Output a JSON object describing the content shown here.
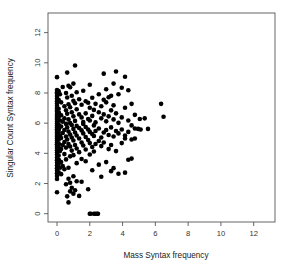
{
  "chart_data": {
    "type": "scatter",
    "title": "",
    "xlabel": "Mass Syntax frequency",
    "ylabel": "Singular Count Syntax frequency",
    "xlim": [
      -0.55,
      13.3
    ],
    "ylim": [
      -0.55,
      13.3
    ],
    "xticks": [
      0,
      2,
      4,
      6,
      8,
      10,
      12
    ],
    "yticks": [
      0,
      2,
      4,
      6,
      8,
      10,
      12
    ],
    "xticklabels": [
      "0",
      "2",
      "4",
      "6",
      "8",
      "10",
      "12"
    ],
    "yticklabels": [
      "0",
      "2",
      "4",
      "6",
      "8",
      "10",
      "12"
    ],
    "grid": false,
    "legend": null,
    "marker": "filled-circle",
    "marker_color": "#000000",
    "marker_size": 2.3,
    "background": "#ffffff",
    "frame": true,
    "n_points": 214,
    "points": [
      [
        0.0,
        9.05
      ],
      [
        0.0,
        8.2
      ],
      [
        0.0,
        8.05
      ],
      [
        0.0,
        7.95
      ],
      [
        0.0,
        7.8
      ],
      [
        0.0,
        7.62
      ],
      [
        0.0,
        7.45
      ],
      [
        0.0,
        7.3
      ],
      [
        0.0,
        7.15
      ],
      [
        0.0,
        7.0
      ],
      [
        0.0,
        6.88
      ],
      [
        0.0,
        6.75
      ],
      [
        0.0,
        6.6
      ],
      [
        0.0,
        6.48
      ],
      [
        0.0,
        6.35
      ],
      [
        0.0,
        6.22
      ],
      [
        0.0,
        6.1
      ],
      [
        0.0,
        5.98
      ],
      [
        0.0,
        5.85
      ],
      [
        0.0,
        5.72
      ],
      [
        0.0,
        5.6
      ],
      [
        0.0,
        5.48
      ],
      [
        0.0,
        5.35
      ],
      [
        0.0,
        5.22
      ],
      [
        0.0,
        5.1
      ],
      [
        0.0,
        4.98
      ],
      [
        0.0,
        4.85
      ],
      [
        0.0,
        4.72
      ],
      [
        0.0,
        4.6
      ],
      [
        0.0,
        4.48
      ],
      [
        0.0,
        4.35
      ],
      [
        0.0,
        4.2
      ],
      [
        0.0,
        4.05
      ],
      [
        0.0,
        3.9
      ],
      [
        0.0,
        3.72
      ],
      [
        0.0,
        3.55
      ],
      [
        0.0,
        3.38
      ],
      [
        0.0,
        3.2
      ],
      [
        0.0,
        3.02
      ],
      [
        0.0,
        2.85
      ],
      [
        0.0,
        2.68
      ],
      [
        0.0,
        2.5
      ],
      [
        0.0,
        2.3
      ],
      [
        0.0,
        1.42
      ],
      [
        0.1,
        8.12
      ],
      [
        0.1,
        7.55
      ],
      [
        0.1,
        6.95
      ],
      [
        0.1,
        6.4
      ],
      [
        0.1,
        5.9
      ],
      [
        0.1,
        5.42
      ],
      [
        0.1,
        4.9
      ],
      [
        0.1,
        4.4
      ],
      [
        0.1,
        3.85
      ],
      [
        0.1,
        3.3
      ],
      [
        0.1,
        2.75
      ],
      [
        0.12,
        6.68
      ],
      [
        0.12,
        5.62
      ],
      [
        0.12,
        4.62
      ],
      [
        0.12,
        3.55
      ],
      [
        0.18,
        7.92
      ],
      [
        0.18,
        6.18
      ],
      [
        0.18,
        5.18
      ],
      [
        0.18,
        4.15
      ],
      [
        0.18,
        3.05
      ],
      [
        0.25,
        7.38
      ],
      [
        0.25,
        6.52
      ],
      [
        0.25,
        5.78
      ],
      [
        0.25,
        5.02
      ],
      [
        0.25,
        4.28
      ],
      [
        0.25,
        3.42
      ],
      [
        0.25,
        2.62
      ],
      [
        0.35,
        8.4
      ],
      [
        0.35,
        6.1
      ],
      [
        0.35,
        5.35
      ],
      [
        0.35,
        4.55
      ],
      [
        0.35,
        3.15
      ],
      [
        0.45,
        7.12
      ],
      [
        0.45,
        6.32
      ],
      [
        0.45,
        5.55
      ],
      [
        0.45,
        4.75
      ],
      [
        0.45,
        3.95
      ],
      [
        0.45,
        2.95
      ],
      [
        0.55,
        8.0
      ],
      [
        0.55,
        6.85
      ],
      [
        0.55,
        5.95
      ],
      [
        0.55,
        5.12
      ],
      [
        0.55,
        4.38
      ],
      [
        0.55,
        3.6
      ],
      [
        0.55,
        1.95
      ],
      [
        0.62,
        9.35
      ],
      [
        0.62,
        7.7
      ],
      [
        0.62,
        6.62
      ],
      [
        0.62,
        5.72
      ],
      [
        0.62,
        4.92
      ],
      [
        0.62,
        1.15
      ],
      [
        0.7,
        8.48
      ],
      [
        0.7,
        7.25
      ],
      [
        0.7,
        6.25
      ],
      [
        0.7,
        5.45
      ],
      [
        0.7,
        4.62
      ],
      [
        0.7,
        3.05
      ],
      [
        0.7,
        2.32
      ],
      [
        0.7,
        0.75
      ],
      [
        0.8,
        8.38
      ],
      [
        0.8,
        7.05
      ],
      [
        0.8,
        6.0
      ],
      [
        0.8,
        5.25
      ],
      [
        0.8,
        4.45
      ],
      [
        0.8,
        3.8
      ],
      [
        0.8,
        2.05
      ],
      [
        0.8,
        1.48
      ],
      [
        0.9,
        7.82
      ],
      [
        0.9,
        6.72
      ],
      [
        0.9,
        5.88
      ],
      [
        0.9,
        5.05
      ],
      [
        0.9,
        4.18
      ],
      [
        0.9,
        1.72
      ],
      [
        1.0,
        8.62
      ],
      [
        1.0,
        7.48
      ],
      [
        1.0,
        6.45
      ],
      [
        1.0,
        5.62
      ],
      [
        1.0,
        4.85
      ],
      [
        1.0,
        3.88
      ],
      [
        1.0,
        2.48
      ],
      [
        1.0,
        1.32
      ],
      [
        1.1,
        9.82
      ],
      [
        1.1,
        7.32
      ],
      [
        1.1,
        6.15
      ],
      [
        1.1,
        5.38
      ],
      [
        1.1,
        4.55
      ],
      [
        1.1,
        1.55
      ],
      [
        1.2,
        8.05
      ],
      [
        1.2,
        6.92
      ],
      [
        1.2,
        5.82
      ],
      [
        1.2,
        5.18
      ],
      [
        1.2,
        4.32
      ],
      [
        1.2,
        3.35
      ],
      [
        1.2,
        2.15
      ],
      [
        1.35,
        7.58
      ],
      [
        1.35,
        6.58
      ],
      [
        1.35,
        5.68
      ],
      [
        1.35,
        4.98
      ],
      [
        1.35,
        4.08
      ],
      [
        1.35,
        1.18
      ],
      [
        1.5,
        7.22
      ],
      [
        1.5,
        6.38
      ],
      [
        1.5,
        5.52
      ],
      [
        1.5,
        4.72
      ],
      [
        1.5,
        3.62
      ],
      [
        1.5,
        2.12
      ],
      [
        1.6,
        8.15
      ],
      [
        1.6,
        6.08
      ],
      [
        1.6,
        5.32
      ],
      [
        1.6,
        4.52
      ],
      [
        1.6,
        5.95
      ],
      [
        1.75,
        7.45
      ],
      [
        1.75,
        6.65
      ],
      [
        1.75,
        5.75
      ],
      [
        1.75,
        5.08
      ],
      [
        1.75,
        4.25
      ],
      [
        1.75,
        3.48
      ],
      [
        1.9,
        7.35
      ],
      [
        1.9,
        6.28
      ],
      [
        1.9,
        5.58
      ],
      [
        1.9,
        4.88
      ],
      [
        1.9,
        1.62
      ],
      [
        2.0,
        8.55
      ],
      [
        2.0,
        7.02
      ],
      [
        2.0,
        6.18
      ],
      [
        2.0,
        5.42
      ],
      [
        2.0,
        4.68
      ],
      [
        2.0,
        3.92
      ],
      [
        2.0,
        0.0
      ],
      [
        2.05,
        0.0
      ],
      [
        2.15,
        7.68
      ],
      [
        2.15,
        6.48
      ],
      [
        2.15,
        5.28
      ],
      [
        2.15,
        4.42
      ],
      [
        2.15,
        2.88
      ],
      [
        2.25,
        6.88
      ],
      [
        2.25,
        5.85
      ],
      [
        2.25,
        5.15
      ],
      [
        2.25,
        4.12
      ],
      [
        2.25,
        0.0
      ],
      [
        2.35,
        7.28
      ],
      [
        2.35,
        6.05
      ],
      [
        2.35,
        5.48
      ],
      [
        2.35,
        4.62
      ],
      [
        2.35,
        0.0
      ],
      [
        2.45,
        0.0
      ],
      [
        2.5,
        0.0
      ],
      [
        2.55,
        7.92
      ],
      [
        2.55,
        6.72
      ],
      [
        2.55,
        5.65
      ],
      [
        2.55,
        4.82
      ],
      [
        2.55,
        3.25
      ],
      [
        2.7,
        7.12
      ],
      [
        2.7,
        6.32
      ],
      [
        2.7,
        5.05
      ],
      [
        2.7,
        4.48
      ],
      [
        2.7,
        2.45
      ],
      [
        2.85,
        9.28
      ],
      [
        2.85,
        7.55
      ],
      [
        2.85,
        6.58
      ],
      [
        2.85,
        5.38
      ],
      [
        2.85,
        4.72
      ],
      [
        3.0,
        8.25
      ],
      [
        3.0,
        7.38
      ],
      [
        3.0,
        6.12
      ],
      [
        3.0,
        5.55
      ],
      [
        3.0,
        3.42
      ],
      [
        3.15,
        7.72
      ],
      [
        3.15,
        6.45
      ],
      [
        3.15,
        5.22
      ],
      [
        3.15,
        4.28
      ],
      [
        3.3,
        7.82
      ],
      [
        3.3,
        6.85
      ],
      [
        3.3,
        5.72
      ],
      [
        3.3,
        4.55
      ],
      [
        3.3,
        2.82
      ],
      [
        3.45,
        8.62
      ],
      [
        3.45,
        7.18
      ],
      [
        3.45,
        6.25
      ],
      [
        3.45,
        5.12
      ],
      [
        3.45,
        3.02
      ],
      [
        3.6,
        9.42
      ],
      [
        3.6,
        6.65
      ],
      [
        3.6,
        5.48
      ],
      [
        3.6,
        4.15
      ],
      [
        3.75,
        7.92
      ],
      [
        3.75,
        6.02
      ],
      [
        3.75,
        5.32
      ],
      [
        3.75,
        2.65
      ],
      [
        3.95,
        8.35
      ],
      [
        3.95,
        6.38
      ],
      [
        3.95,
        5.58
      ],
      [
        3.95,
        4.68
      ],
      [
        4.15,
        9.08
      ],
      [
        4.15,
        7.02
      ],
      [
        4.15,
        5.18
      ],
      [
        4.15,
        4.98
      ],
      [
        4.15,
        2.72
      ],
      [
        4.35,
        8.18
      ],
      [
        4.35,
        6.18
      ],
      [
        4.35,
        5.42
      ],
      [
        4.35,
        3.58
      ],
      [
        4.55,
        7.28
      ],
      [
        4.55,
        5.85
      ],
      [
        4.55,
        4.92
      ],
      [
        4.55,
        3.65
      ],
      [
        4.75,
        6.55
      ],
      [
        4.75,
        5.65
      ],
      [
        4.75,
        4.98
      ],
      [
        4.95,
        5.62
      ],
      [
        5.05,
        6.28
      ],
      [
        5.1,
        5.58
      ],
      [
        5.35,
        6.32
      ],
      [
        5.55,
        5.62
      ],
      [
        6.35,
        7.28
      ],
      [
        6.5,
        6.42
      ]
    ]
  },
  "axis_titles": {
    "x": "Mass Syntax frequency",
    "y": "Singular Count Syntax frequency"
  }
}
